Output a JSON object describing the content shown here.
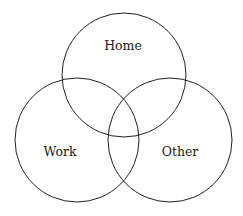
{
  "diagram": {
    "type": "venn",
    "sets": [
      {
        "label": "Home",
        "cx": 124,
        "cy": 75,
        "r": 62,
        "label_x": 123,
        "label_y": 50
      },
      {
        "label": "Work",
        "cx": 77,
        "cy": 140,
        "r": 62,
        "label_x": 60,
        "label_y": 156
      },
      {
        "label": "Other",
        "cx": 170,
        "cy": 140,
        "r": 62,
        "label_x": 180,
        "label_y": 156
      }
    ],
    "stroke_color": "#222222",
    "background_color": "#ffffff"
  }
}
